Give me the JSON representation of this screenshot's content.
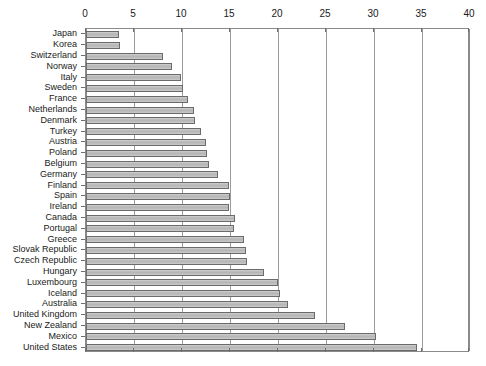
{
  "chart_data": {
    "type": "bar",
    "orientation": "horizontal",
    "title": "",
    "subtitle": "",
    "xlabel": "",
    "ylabel": "",
    "xlim": [
      0,
      40
    ],
    "xticks": [
      0,
      5,
      10,
      15,
      20,
      25,
      30,
      35,
      40
    ],
    "xtick_labels": [
      "0",
      "5",
      "10",
      "15",
      "20",
      "25",
      "30",
      "35",
      "40"
    ],
    "grid": true,
    "grid_axis": "x",
    "legend": false,
    "legend_position": "none",
    "bar_fill_color": "#c0c0c0",
    "bar_edge_color": "#6b6b6b",
    "axis_color": "#8a8a8a",
    "categories": [
      "Japan",
      "Korea",
      "Switzerland",
      "Norway",
      "Italy",
      "Sweden",
      "France",
      "Netherlands",
      "Denmark",
      "Turkey",
      "Austria",
      "Poland",
      "Belgium",
      "Germany",
      "Finland",
      "Spain",
      "Ireland",
      "Canada",
      "Portugal",
      "Greece",
      "Slovak Republic",
      "Czech Republic",
      "Hungary",
      "Luxembourg",
      "Iceland",
      "Australia",
      "United Kingdom",
      "New Zealand",
      "Mexico",
      "United States"
    ],
    "values": [
      3.4,
      3.5,
      8.0,
      9.0,
      9.9,
      10.1,
      10.6,
      11.2,
      11.4,
      12.0,
      12.5,
      12.6,
      12.8,
      13.8,
      14.9,
      15.0,
      14.9,
      15.5,
      15.4,
      16.5,
      16.7,
      16.8,
      18.5,
      20.0,
      20.2,
      21.0,
      23.9,
      27.0,
      30.2,
      34.5
    ]
  }
}
